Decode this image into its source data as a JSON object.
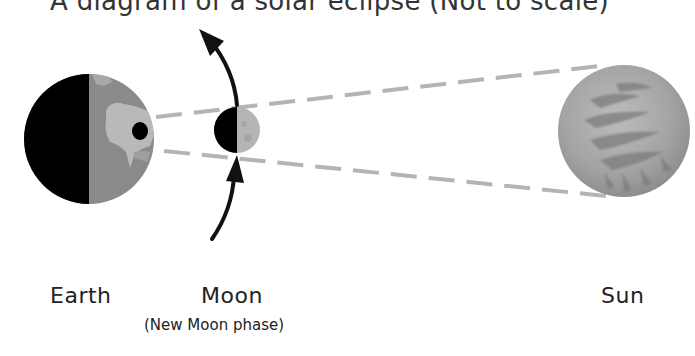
{
  "title": "A diagram of a solar eclipse (Not to scale)",
  "bodies": {
    "earth": {
      "label": "Earth"
    },
    "moon": {
      "label": "Moon",
      "phase_note": "(New Moon phase)"
    },
    "sun": {
      "label": "Sun"
    }
  },
  "icons": {
    "orbit_arrow_up": "orbit-direction-arrow",
    "orbit_arrow_in": "orbit-direction-arrow"
  },
  "colors": {
    "night_side": "#000000",
    "earth_ocean": "#8a8a8a",
    "earth_land": "#b9b9b9",
    "umbra_spot": "#050505",
    "moon_lit": "#b5b5b5",
    "sun_fill": "#a9a9a9",
    "shadow_cone_lines": "#b4b4b4",
    "arrows": "#111111"
  }
}
